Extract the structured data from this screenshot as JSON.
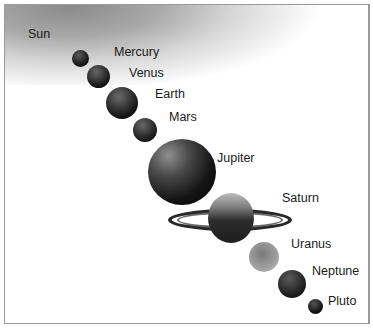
{
  "diagram": {
    "title": "",
    "type": "solar-system-bodies",
    "bodies": [
      {
        "name": "Sun"
      },
      {
        "name": "Mercury"
      },
      {
        "name": "Venus"
      },
      {
        "name": "Earth"
      },
      {
        "name": "Mars"
      },
      {
        "name": "Jupiter"
      },
      {
        "name": "Saturn"
      },
      {
        "name": "Uranus"
      },
      {
        "name": "Neptune"
      },
      {
        "name": "Pluto"
      }
    ]
  }
}
